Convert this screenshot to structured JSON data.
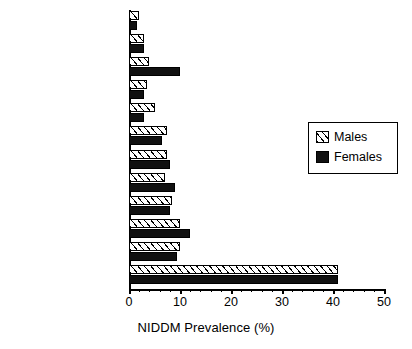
{
  "chart_data": {
    "type": "bar",
    "orientation": "horizontal",
    "title": "",
    "xlabel": "NIDDM Prevalence (%)",
    "ylabel": "",
    "xlim": [
      0,
      50
    ],
    "xticks": [
      0,
      10,
      20,
      30,
      40,
      50
    ],
    "xtick_labels": [
      "0",
      "10",
      "20",
      "30",
      "40",
      "50"
    ],
    "grid": false,
    "legend_position": "right-middle",
    "categories": [
      "China",
      "U.S. (Caucasian)",
      "Malaysia",
      "Poland",
      "Sri Lanka",
      "South Africa",
      "Brazili",
      "Columbia",
      "Tunisia",
      "Japan",
      "Italy",
      "Nauru"
    ],
    "series": [
      {
        "name": "Males",
        "pattern": "hatched",
        "color": "#ffffff",
        "values": [
          2,
          3,
          4,
          3.5,
          5,
          7.5,
          7.5,
          7,
          8.5,
          10,
          10,
          41
        ]
      },
      {
        "name": "Females",
        "pattern": "solid",
        "color": "#111111",
        "values": [
          1.5,
          3,
          10,
          3,
          3,
          6.5,
          8,
          9,
          8,
          12,
          9.5,
          41
        ]
      }
    ]
  },
  "legend": {
    "entries": [
      {
        "label": "Males",
        "swatch": "hatched-swatch"
      },
      {
        "label": "Females",
        "swatch": "solid-black-swatch"
      }
    ]
  }
}
